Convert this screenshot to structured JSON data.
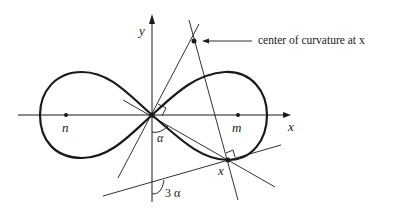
{
  "diagram": {
    "type": "lemniscate-curvature",
    "labels": {
      "y_axis": "y",
      "x_axis": "x",
      "focus_left": "n",
      "focus_right": "m",
      "point": "x",
      "angle_alpha": "α",
      "angle_three_alpha": "3 α",
      "annotation": "center of curvature at x"
    },
    "colors": {
      "stroke": "#1a1a1a",
      "background": "#ffffff"
    }
  }
}
